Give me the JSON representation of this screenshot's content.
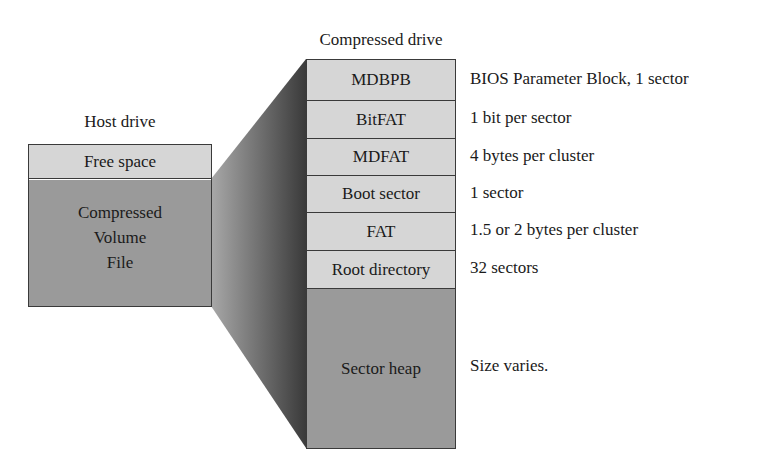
{
  "host_drive": {
    "title": "Host drive",
    "free_space": "Free space",
    "cvf_lines": [
      "Compressed",
      "Volume",
      "File"
    ]
  },
  "compressed_drive": {
    "title": "Compressed drive",
    "rows": [
      {
        "label": "MDBPB",
        "description": "BIOS Parameter Block, 1 sector"
      },
      {
        "label": "BitFAT",
        "description": "1 bit per sector"
      },
      {
        "label": "MDFAT",
        "description": "4 bytes per cluster"
      },
      {
        "label": "Boot sector",
        "description": "1 sector"
      },
      {
        "label": "FAT",
        "description": "1.5 or 2 bytes per cluster"
      },
      {
        "label": "Root directory",
        "description": "32 sectors"
      }
    ],
    "heap": {
      "label": "Sector heap",
      "description": "Size varies."
    }
  },
  "colors": {
    "light_fill": "#d6d6d6",
    "dark_fill": "#9a9a9a",
    "connector_dark": "#3c3c3c",
    "connector_light": "#a0a0a0",
    "border": "#3a3a3a"
  }
}
